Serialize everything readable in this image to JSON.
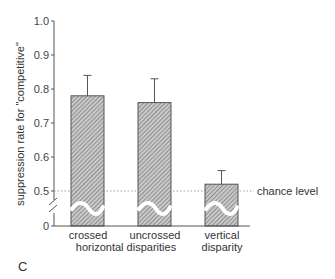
{
  "chart_data": {
    "type": "bar",
    "title": "",
    "panel_label": "C",
    "ylabel": "suppression  rate  for  \"competitive\"",
    "xlabel": "",
    "ylim": [
      0,
      1.0
    ],
    "axis_break": true,
    "yticks": [
      {
        "value": 0,
        "label": "0"
      },
      {
        "value": 0.5,
        "label": "0.5"
      },
      {
        "value": 0.6,
        "label": "0.6"
      },
      {
        "value": 0.7,
        "label": "0.7"
      },
      {
        "value": 0.8,
        "label": "0.8"
      },
      {
        "value": 0.9,
        "label": "0.9"
      },
      {
        "value": 1.0,
        "label": "1.0"
      }
    ],
    "categories": [
      "crossed",
      "uncrossed",
      "vertical disparity"
    ],
    "group_labels": {
      "line1": [
        "crossed",
        "uncrossed",
        "vertical"
      ],
      "line2_left": "horizontal disparities",
      "line2_right": "disparity"
    },
    "values": [
      0.78,
      0.76,
      0.52
    ],
    "error_upper": [
      0.84,
      0.83,
      0.56
    ],
    "reference_line": {
      "value": 0.5,
      "label": "chance level",
      "style": "dotted"
    },
    "grid": false,
    "legend": null
  },
  "colors": {
    "axis": "#555555",
    "bar_fill": "#b8b8b8",
    "hatch": "#6a6a6a",
    "ref": "#777777"
  }
}
